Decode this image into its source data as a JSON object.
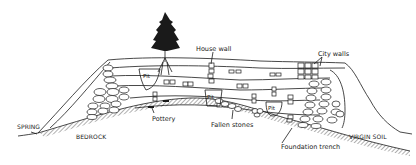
{
  "diagram": {
    "type": "archaeological tell cross-section",
    "labels": {
      "house_wall": "House wall",
      "city_walls": "City walls",
      "pit": "Pit",
      "pottery": "Pottery",
      "fallen_stones": "Fallen stones",
      "spring": "SPRING",
      "bedrock": "BEDROCK",
      "virgin_soil": "VIRGIN SOIL",
      "foundation_trench": "Foundation trench"
    },
    "colors": {
      "ink": "#1a1a1a",
      "background": "#ffffff"
    }
  }
}
